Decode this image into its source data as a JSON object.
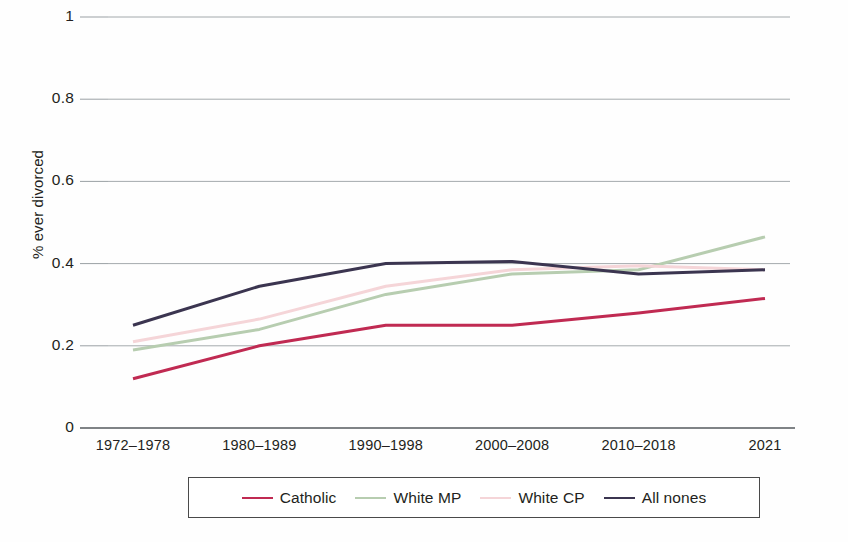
{
  "chart_data": {
    "type": "line",
    "title": "",
    "xlabel": "",
    "ylabel": "% ever divorced",
    "categories": [
      "1972–1978",
      "1980–1989",
      "1990–1998",
      "2000–2008",
      "2010–2018",
      "2021"
    ],
    "ylim": [
      0,
      1
    ],
    "yticks": [
      "0",
      "0.2",
      "0.4",
      "0.6",
      "0.8",
      "1"
    ],
    "ytick_values": [
      0,
      0.2,
      0.4,
      0.6,
      0.8,
      1
    ],
    "grid": true,
    "grid_axis": "y",
    "legend_position": "bottom",
    "series": [
      {
        "name": "Catholic",
        "color": "#c02a52",
        "values": [
          0.12,
          0.2,
          0.25,
          0.25,
          0.28,
          0.315
        ]
      },
      {
        "name": "White MP",
        "color": "#b7cdb0",
        "values": [
          0.19,
          0.24,
          0.325,
          0.375,
          0.385,
          0.465
        ]
      },
      {
        "name": "White CP",
        "color": "#f5d5d8",
        "values": [
          0.21,
          0.265,
          0.345,
          0.385,
          0.395,
          0.385
        ]
      },
      {
        "name": "All nones",
        "color": "#3b3550",
        "values": [
          0.25,
          0.345,
          0.4,
          0.405,
          0.375,
          0.385
        ]
      }
    ]
  },
  "axis": {
    "axis_line_color": "#555a5e",
    "grid_color": "#9aa0a4"
  },
  "legend": {
    "entries": [
      {
        "label": "Catholic",
        "color": "#c02a52"
      },
      {
        "label": "White MP",
        "color": "#b7cdb0"
      },
      {
        "label": "White CP",
        "color": "#f5d5d8"
      },
      {
        "label": "All nones",
        "color": "#3b3550"
      }
    ]
  }
}
